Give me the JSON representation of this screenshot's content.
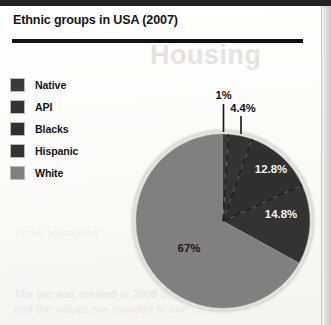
{
  "header": {
    "title": "Ethnic groups in USA (2007)"
  },
  "legend": {
    "items": [
      {
        "label": "Native",
        "color": "#3b3b3b"
      },
      {
        "label": "API",
        "color": "#343434"
      },
      {
        "label": "Blacks",
        "color": "#303030"
      },
      {
        "label": "Hispanic",
        "color": "#333333"
      },
      {
        "label": "White",
        "color": "#808080"
      }
    ]
  },
  "artifacts": {
    "ghost_header": "Housing",
    "ghost_line_1": "The pie was created in 2008 using census data",
    "ghost_line_2": "and the values are rounded to one decimal",
    "ghost_line_3": "of the population"
  },
  "chart_data": {
    "type": "pie",
    "title": "Ethnic groups in USA (2007)",
    "xlabel": "",
    "ylabel": "",
    "grid": false,
    "legend_position": "left",
    "start_angle_deg": 0,
    "direction": "clockwise",
    "labels": [
      "Native",
      "API",
      "Blacks",
      "Hispanic",
      "White"
    ],
    "values": [
      1,
      4.4,
      12.8,
      14.8,
      67
    ],
    "value_labels": [
      "1%",
      "4.4%",
      "12.8%",
      "14.8%",
      "67%"
    ],
    "colors": [
      "#3b3b3b",
      "#343434",
      "#303030",
      "#333333",
      "#808080"
    ],
    "label_placement": [
      "callout",
      "callout",
      "inside",
      "inside",
      "inside"
    ],
    "slices": [
      {
        "name": "Native",
        "value": 1,
        "value_label": "1%",
        "color": "#3b3b3b",
        "label_placement": "callout"
      },
      {
        "name": "API",
        "value": 4.4,
        "value_label": "4.4%",
        "color": "#343434",
        "label_placement": "callout"
      },
      {
        "name": "Blacks",
        "value": 12.8,
        "value_label": "12.8%",
        "color": "#303030",
        "label_placement": "inside"
      },
      {
        "name": "Hispanic",
        "value": 14.8,
        "value_label": "14.8%",
        "color": "#333333",
        "label_placement": "inside"
      },
      {
        "name": "White",
        "value": 67,
        "value_label": "67%",
        "color": "#808080",
        "label_placement": "inside"
      }
    ],
    "total": 100
  }
}
